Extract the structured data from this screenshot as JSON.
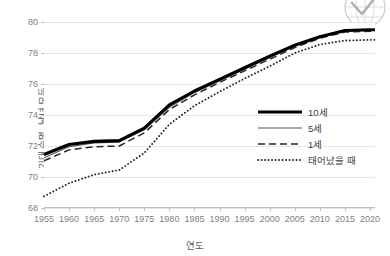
{
  "chart_data": {
    "type": "line",
    "title": "",
    "xlabel": "연도",
    "ylabel": "기대 수명, 남녀 모두",
    "xlim": [
      1955,
      2021
    ],
    "ylim": [
      68,
      80
    ],
    "xticks": [
      "1955",
      "1960",
      "1965",
      "1970",
      "1975",
      "1980",
      "1985",
      "1990",
      "1995",
      "2000",
      "2005",
      "2010",
      "2015",
      "2020"
    ],
    "yticks": [
      "68",
      "70",
      "72",
      "74",
      "76",
      "78",
      "80"
    ],
    "grid": "horizontal",
    "legend_position": "inside-right",
    "x": [
      1955,
      1960,
      1965,
      1970,
      1975,
      1980,
      1985,
      1990,
      1995,
      2000,
      2005,
      2010,
      2015,
      2020,
      2021
    ],
    "series": [
      {
        "name": "10세",
        "style": "solid-thick",
        "color": "#000000",
        "values": [
          71.45,
          72.1,
          72.3,
          72.35,
          73.15,
          74.65,
          75.55,
          76.3,
          77.05,
          77.8,
          78.5,
          79.05,
          79.45,
          79.5,
          79.5
        ]
      },
      {
        "name": "5세",
        "style": "solid-thin",
        "color": "#595959",
        "values": [
          71.25,
          71.95,
          72.2,
          72.25,
          73.05,
          74.5,
          75.45,
          76.2,
          76.95,
          77.7,
          78.45,
          79.0,
          79.4,
          79.45,
          79.45
        ]
      },
      {
        "name": "1세",
        "style": "dashed",
        "color": "#262626",
        "values": [
          71.05,
          71.75,
          71.95,
          72.0,
          72.85,
          74.35,
          75.3,
          76.1,
          76.85,
          77.6,
          78.35,
          78.95,
          79.35,
          79.4,
          79.4
        ]
      },
      {
        "name": "태어났을 때",
        "style": "dotted",
        "color": "#262626",
        "values": [
          68.75,
          69.6,
          70.15,
          70.45,
          71.55,
          73.4,
          74.6,
          75.5,
          76.35,
          77.15,
          78.0,
          78.55,
          78.8,
          78.85,
          78.85
        ]
      }
    ]
  },
  "logo": {
    "name": "globe-watermark"
  }
}
